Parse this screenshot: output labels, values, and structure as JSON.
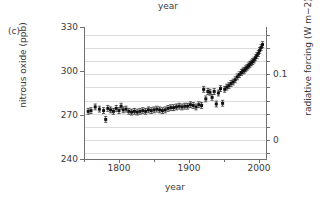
{
  "panel": {
    "label": "(c)"
  },
  "top_axis": {
    "title": "year"
  },
  "chart_data": {
    "type": "scatter",
    "title": "",
    "subtitle": "",
    "xlabel": "year",
    "ylabel": "nitrous oxide (ppb)",
    "y2label": "radiative forcing (W m−2)",
    "xlim": [
      1750,
      2010
    ],
    "ylim": [
      240,
      330
    ],
    "y2lim": [
      -0.0285,
      0.1715
    ],
    "xticks": [
      1750,
      1800,
      1850,
      1900,
      1950,
      2000
    ],
    "xticklabels": [
      "",
      "1800",
      "",
      "1900",
      "",
      "2000"
    ],
    "yticks": [
      240,
      270,
      300,
      330
    ],
    "yticklabels": [
      "240",
      "270",
      "300",
      "330"
    ],
    "y2ticks": [
      -0.02,
      0.0,
      0.02,
      0.04,
      0.06,
      0.08,
      0.1,
      0.12,
      0.14,
      0.16
    ],
    "y2ticklabels": [
      "",
      "0",
      "",
      "",
      "",
      "",
      "0.1",
      "",
      "",
      ""
    ],
    "grid": "horizontal",
    "legend": "none",
    "marker": "filled-square-with-vertical-errorbars",
    "errorbar_ppb": 2.0,
    "series": [
      {
        "name": "nitrous oxide (ice core + firn + atmospheric)",
        "x": [
          1756,
          1760,
          1766,
          1772,
          1778,
          1781,
          1784,
          1788,
          1792,
          1796,
          1800,
          1803,
          1806,
          1810,
          1814,
          1818,
          1822,
          1826,
          1830,
          1834,
          1838,
          1842,
          1846,
          1850,
          1854,
          1858,
          1862,
          1866,
          1870,
          1874,
          1878,
          1882,
          1886,
          1890,
          1894,
          1898,
          1902,
          1906,
          1910,
          1914,
          1918,
          1921,
          1924,
          1927,
          1930,
          1933,
          1936,
          1939,
          1942,
          1945,
          1948,
          1951,
          1954,
          1957,
          1960,
          1963,
          1966,
          1969,
          1972,
          1975,
          1977,
          1979,
          1981,
          1983,
          1985,
          1987,
          1989,
          1991,
          1993,
          1995,
          1997,
          1999,
          2001,
          2003,
          2005
        ],
        "y": [
          272.5,
          273.0,
          275.5,
          274.0,
          273.0,
          267.0,
          274.5,
          273.5,
          272.5,
          274.5,
          273.0,
          276.0,
          273.5,
          274.0,
          272.5,
          272.0,
          272.5,
          272.0,
          272.5,
          273.0,
          272.5,
          273.5,
          273.0,
          273.5,
          274.0,
          273.5,
          273.0,
          273.5,
          274.5,
          275.0,
          275.0,
          275.5,
          276.0,
          275.5,
          276.0,
          276.0,
          277.0,
          276.5,
          275.5,
          277.0,
          276.5,
          287.5,
          281.0,
          286.0,
          285.5,
          282.0,
          286.0,
          277.5,
          285.0,
          288.0,
          278.0,
          287.5,
          289.0,
          290.0,
          291.5,
          292.5,
          294.0,
          296.0,
          297.5,
          299.0,
          300.0,
          300.5,
          301.5,
          302.5,
          303.5,
          304.5,
          305.5,
          306.5,
          307.5,
          309.0,
          310.5,
          312.0,
          314.0,
          316.0,
          318.0
        ]
      }
    ]
  }
}
